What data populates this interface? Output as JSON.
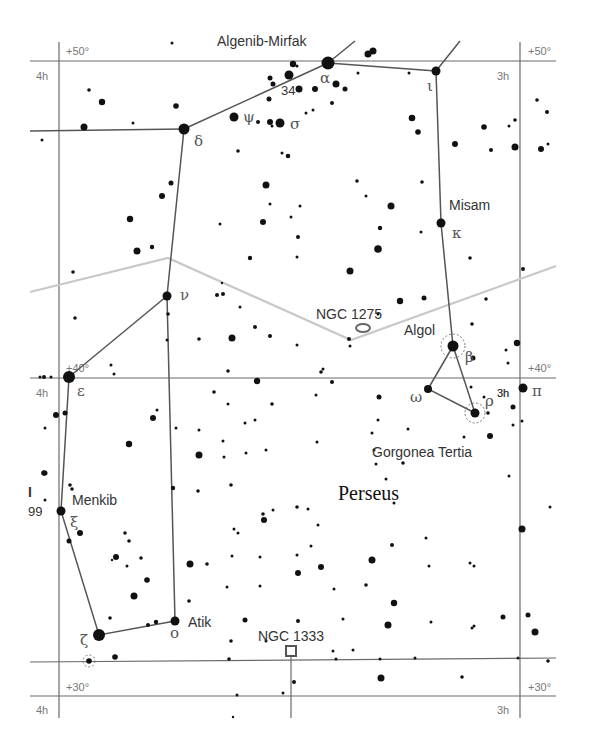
{
  "map": {
    "constellation": "Perseus",
    "colors": {
      "background": "#ffffff",
      "grid": "#6a6a6a",
      "boundary": "#c8c8c8",
      "figure": "#555555",
      "star": "#111111"
    },
    "grid_labels": {
      "dec_top_left": "+50°",
      "dec_top_right": "+50°",
      "dec_mid_left": "+40°",
      "dec_mid_right": "+40°",
      "dec_bottom_left": "+30°",
      "dec_bottom_right": "+30°",
      "ra_top_left": "4h",
      "ra_top_right": "3h",
      "ra_mid_left": "4h",
      "ra_mid_right": "3h",
      "ra_bottom_left": "4h",
      "ra_bottom_right": "3h"
    },
    "star_names": {
      "algenib_mirfak": "Algenib-Mirfak",
      "misam": "Misam",
      "algol": "Algol",
      "gorgonea_tertia": "Gorgonea Tertia",
      "menkib": "Menkib",
      "atik": "Atik"
    },
    "greek_labels": {
      "alpha": "α",
      "iota": "ι",
      "delta": "δ",
      "psi": "ψ",
      "sigma": "σ",
      "kappa": "κ",
      "nu": "ν",
      "beta": "β",
      "omega": "ω",
      "rho": "ρ",
      "pi": "π",
      "epsilon": "ε",
      "xi": "ξ",
      "zeta": "ζ",
      "omicron": "ο"
    },
    "flamsteed_labels": {
      "f34": "34"
    },
    "edge_labels": {
      "left_I": "I",
      "left_99": "99"
    },
    "deep_sky": {
      "ngc1275": "NGC 1275",
      "ngc1333": "NGC 1333"
    }
  }
}
